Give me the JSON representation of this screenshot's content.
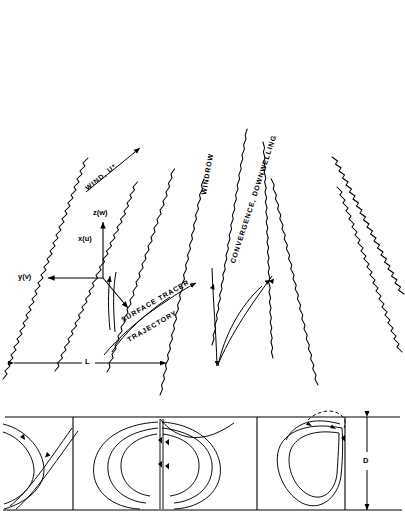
{
  "figure": {
    "type": "schematic-diagram",
    "background_color": "#ffffff",
    "line_color": "#000000"
  },
  "labels": {
    "wind": "WIND, U*",
    "windrow": "WINDROW",
    "convergence": "CONVERGENCE, DOWNWELLING",
    "tracer_line1": "SURFACE TRACER",
    "tracer_line2": "TRAJECTORY",
    "axis_z": "z(w)",
    "axis_x": "x(u)",
    "axis_y": "y(v)",
    "spacing": "L",
    "depth": "D"
  },
  "upper_panel": {
    "name": "perspective-sea-surface-view",
    "windrow_streak_count": 9,
    "description": "Wavy convergent windrow streak lines radiating in perspective toward horizon"
  },
  "lower_panel": {
    "name": "cross-section-view",
    "cell_count": 3,
    "divider_count": 2,
    "description": "Vertical cross-section showing counter-rotating Langmuir vortex cells of depth D"
  }
}
